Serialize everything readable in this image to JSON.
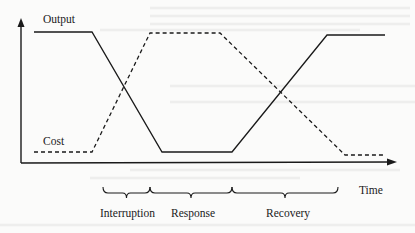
{
  "diagram": {
    "title": "",
    "axes": {
      "y_label": "Output",
      "x_label": "Time"
    },
    "series": [
      {
        "name": "Output",
        "style": "solid",
        "color": "#1a1a1a",
        "points": [
          [
            34,
            32
          ],
          [
            92,
            32
          ],
          [
            162,
            152
          ],
          [
            232,
            152
          ],
          [
            327,
            35
          ],
          [
            385,
            35
          ]
        ]
      },
      {
        "name": "Cost",
        "label": "Cost",
        "style": "dashed",
        "color": "#1a1a1a",
        "points": [
          [
            34,
            152
          ],
          [
            92,
            152
          ],
          [
            150,
            33
          ],
          [
            220,
            33
          ],
          [
            345,
            155
          ],
          [
            383,
            155
          ]
        ]
      }
    ],
    "phases": [
      {
        "label": "Interruption",
        "x_start": 103,
        "x_end": 150
      },
      {
        "label": "Response",
        "x_start": 150,
        "x_end": 232
      },
      {
        "label": "Recovery",
        "x_start": 232,
        "x_end": 338
      }
    ]
  },
  "colors": {
    "ink": "#1a1a1a",
    "paper": "#fbfbfa",
    "bleed_through": "#e6e6e4"
  }
}
